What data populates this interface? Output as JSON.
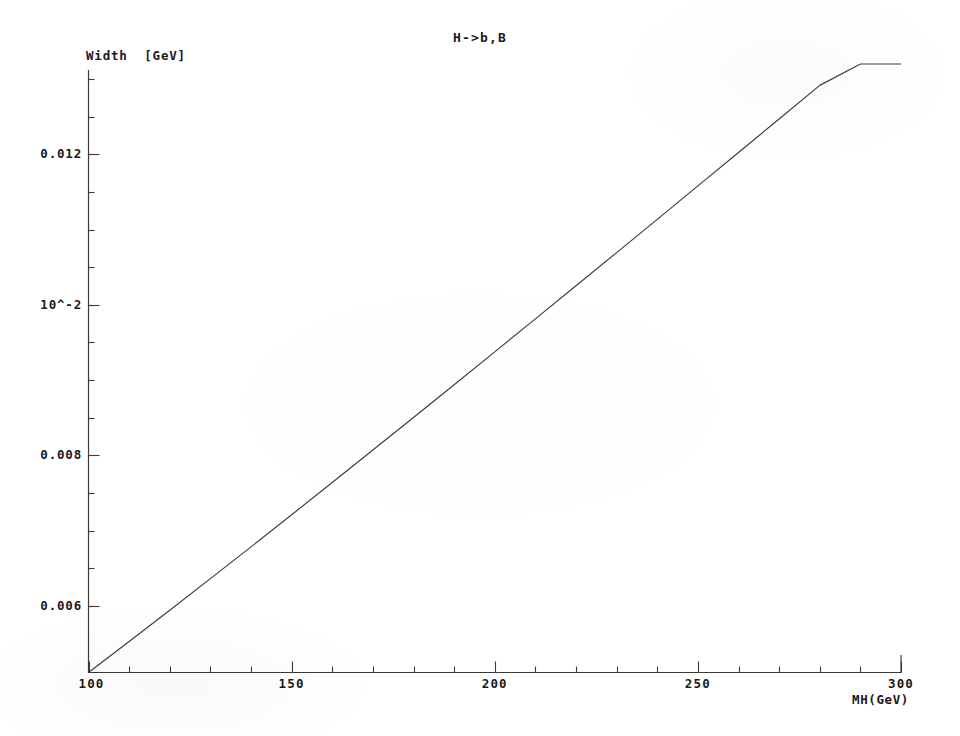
{
  "figure": {
    "title": "H->b,B",
    "background_color": "#ffffff",
    "ink_color": "#2b2b2b"
  },
  "chart_data": {
    "type": "line",
    "title": "H->b,B",
    "xlabel": "MH(GeV)",
    "ylabel": "Width  [GeV]",
    "grid": false,
    "legend": false,
    "xlim": [
      100,
      300
    ],
    "ylim": [
      0.005114,
      0.0132
    ],
    "x_ticks_major": [
      100,
      150,
      200,
      250,
      300
    ],
    "x_tick_labels": [
      "100",
      "150",
      "200",
      "250",
      "300"
    ],
    "x_minor_tick_step": 10,
    "y_ticks_major": [
      0.006,
      0.008,
      0.01,
      0.012
    ],
    "y_tick_labels": [
      "0.006",
      "0.008",
      "10^-2",
      "0.012"
    ],
    "y_minor_tick_step": 0.001,
    "series": [
      {
        "name": "Width(H->b,B)",
        "x": [
          100,
          110,
          120,
          130,
          140,
          150,
          160,
          170,
          180,
          190,
          200,
          210,
          220,
          230,
          240,
          250,
          260,
          270,
          280,
          290,
          300
        ],
        "y": [
          0.005114,
          0.005525,
          0.005941,
          0.006361,
          0.006784,
          0.00721,
          0.007639,
          0.00807,
          0.008503,
          0.008938,
          0.009375,
          0.009813,
          0.010253,
          0.010694,
          0.011136,
          0.01158,
          0.012024,
          0.01247,
          0.012916,
          0.013363,
          0.0132
        ]
      }
    ]
  }
}
